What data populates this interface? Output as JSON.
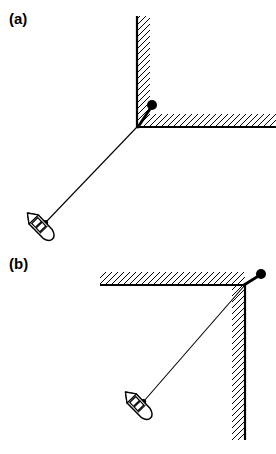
{
  "figure": {
    "type": "technical-line-diagram",
    "background_color": "#ffffff",
    "line_color": "#000000",
    "panels": [
      {
        "id": "a",
        "label": "(a)",
        "label_position": {
          "x": 9,
          "y": 11
        },
        "corner": {
          "x": 137,
          "y": 127
        },
        "walls": [
          {
            "name": "vertical-wall",
            "orientation": "vertical",
            "solid_edge": "left",
            "hatch_side": "right",
            "from": {
              "x": 137,
              "y": 16
            },
            "to": {
              "x": 137,
              "y": 127
            }
          },
          {
            "name": "horizontal-wall",
            "orientation": "horizontal",
            "solid_edge": "bottom",
            "hatch_side": "above",
            "from": {
              "x": 137,
              "y": 127
            },
            "to": {
              "x": 276,
              "y": 127
            }
          }
        ],
        "marker_dot": {
          "x": 152,
          "y": 105,
          "radius": 5,
          "filled": true
        },
        "stub_line": {
          "from": {
            "x": 137,
            "y": 127
          },
          "to": {
            "x": 152,
            "y": 105
          },
          "width": 2.6
        },
        "tether_line": {
          "from": {
            "x": 137,
            "y": 127
          },
          "to": {
            "x": 46,
            "y": 222
          },
          "width": 1.1
        },
        "vessel": {
          "x": 40,
          "y": 226,
          "angle_deg": 46,
          "length": 36,
          "beam": 13
        }
      },
      {
        "id": "b",
        "label": "(b)",
        "label_position": {
          "x": 9,
          "y": 256
        },
        "corner": {
          "x": 245,
          "y": 285
        },
        "walls": [
          {
            "name": "horizontal-wall",
            "orientation": "horizontal",
            "solid_edge": "bottom",
            "hatch_side": "above",
            "from": {
              "x": 100,
              "y": 285
            },
            "to": {
              "x": 245,
              "y": 285
            }
          },
          {
            "name": "vertical-wall",
            "orientation": "vertical",
            "solid_edge": "right",
            "hatch_side": "left",
            "from": {
              "x": 245,
              "y": 285
            },
            "to": {
              "x": 245,
              "y": 440
            }
          }
        ],
        "marker_dot": {
          "x": 261,
          "y": 274,
          "radius": 5,
          "filled": true
        },
        "stub_line": {
          "from": {
            "x": 245,
            "y": 285
          },
          "to": {
            "x": 261,
            "y": 274
          },
          "width": 2.6
        },
        "tether_line": {
          "from": {
            "x": 245,
            "y": 285
          },
          "to": {
            "x": 144,
            "y": 401
          },
          "width": 1.1
        },
        "vessel": {
          "x": 138,
          "y": 405,
          "angle_deg": 46,
          "length": 36,
          "beam": 13
        }
      }
    ]
  }
}
